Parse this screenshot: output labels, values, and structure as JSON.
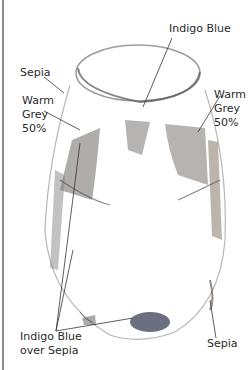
{
  "figure": {
    "labels": {
      "indigo_top": "Indigo Blue",
      "sepia_left": "Sepia",
      "warm_grey_left": "Warm\nGrey\n50%",
      "warm_grey_right": "Warm\nGrey\n50%",
      "indigo_over_sepia": "Indigo Blue\nover Sepia",
      "sepia_right": "Sepia"
    },
    "colors": {
      "label_text": "#2a2a2a",
      "leader_line": "#333333",
      "sepia": "#6b5a4a",
      "warm_grey": "#8a8580",
      "indigo": "#3a3f55",
      "frame": "#8a8a8a"
    }
  }
}
